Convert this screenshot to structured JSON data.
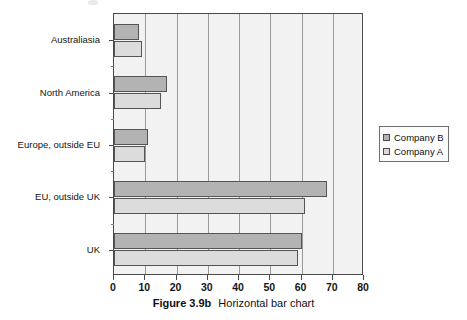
{
  "caption": {
    "label": "Figure 3.9b",
    "text": "Horizontal bar chart"
  },
  "legend": {
    "items": [
      {
        "label": "Company B",
        "color": "#b3b3b3"
      },
      {
        "label": "Company A",
        "color": "#dcdcdc"
      }
    ]
  },
  "chart_data": {
    "type": "bar",
    "orientation": "horizontal",
    "title": "",
    "subtitle": "",
    "xlabel": "",
    "ylabel": "",
    "categories": [
      "UK",
      "EU, outside UK",
      "Europe, outside EU",
      "North America",
      "Australiasia"
    ],
    "series": [
      {
        "name": "Company A",
        "color": "#dcdcdc",
        "values": [
          59,
          61,
          10,
          15,
          9
        ]
      },
      {
        "name": "Company B",
        "color": "#b3b3b3",
        "values": [
          60,
          68,
          11,
          17,
          8
        ]
      }
    ],
    "xlim": [
      0,
      80
    ],
    "xticks": [
      0,
      10,
      20,
      30,
      40,
      50,
      60,
      70,
      80
    ],
    "xticklabels": [
      "0",
      "10",
      "20",
      "30",
      "40",
      "50",
      "60",
      "70",
      "80"
    ],
    "grid": "vertical",
    "legend_position": "right-outside",
    "plot_background": "#f2f2f2",
    "axis_color": "#4a4a4a",
    "gridline_color": "#9a9a9a"
  }
}
